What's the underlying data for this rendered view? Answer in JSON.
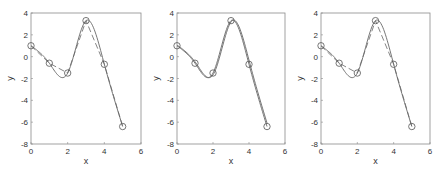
{
  "chart_data": [
    {
      "type": "line",
      "title": "",
      "xlabel": "x",
      "ylabel": "y",
      "xlim": [
        0,
        6
      ],
      "ylim": [
        -8,
        4
      ],
      "xticks": [
        0,
        2,
        4,
        6
      ],
      "yticks": [
        4,
        2,
        0,
        -2,
        -4,
        -6,
        -8
      ],
      "grid": false,
      "legend": null,
      "series": [
        {
          "name": "data",
          "style": "markers-circle",
          "x": [
            0,
            1,
            2,
            3,
            4,
            5
          ],
          "y": [
            1.0,
            -0.6,
            -1.5,
            3.3,
            -0.7,
            -6.4
          ]
        },
        {
          "name": "linear",
          "style": "dashed",
          "x": [
            0,
            1,
            2,
            3,
            4,
            5
          ],
          "y": [
            1.0,
            -0.6,
            -1.5,
            3.3,
            -0.7,
            -6.4
          ]
        },
        {
          "name": "spline",
          "style": "solid",
          "method": "cubic-spline"
        }
      ]
    },
    {
      "type": "line",
      "title": "",
      "xlabel": "x",
      "ylabel": "y",
      "xlim": [
        0,
        6
      ],
      "ylim": [
        -8,
        4
      ],
      "xticks": [
        0,
        2,
        4,
        6
      ],
      "yticks": [
        4,
        2,
        0,
        -2,
        -4,
        -6,
        -8
      ],
      "grid": false,
      "legend": null,
      "series": [
        {
          "name": "data",
          "style": "markers-circle",
          "x": [
            0,
            1,
            2,
            3,
            4,
            5
          ],
          "y": [
            1.0,
            -0.6,
            -1.5,
            3.3,
            -0.7,
            -6.4
          ]
        },
        {
          "name": "spline",
          "style": "solid",
          "method": "cubic-spline"
        },
        {
          "name": "spline-alt",
          "style": "solid",
          "method": "cubic-spline-shifted"
        }
      ]
    },
    {
      "type": "line",
      "title": "",
      "xlabel": "x",
      "ylabel": "y",
      "xlim": [
        0,
        6
      ],
      "ylim": [
        -8,
        4
      ],
      "xticks": [
        0,
        2,
        4,
        6
      ],
      "yticks": [
        4,
        2,
        0,
        -2,
        -4,
        -6,
        -8
      ],
      "grid": false,
      "legend": null,
      "series": [
        {
          "name": "data",
          "style": "markers-circle",
          "x": [
            0,
            1,
            2,
            3,
            4,
            5
          ],
          "y": [
            1.0,
            -0.6,
            -1.5,
            3.3,
            -0.7,
            -6.4
          ]
        },
        {
          "name": "linear",
          "style": "dashed",
          "x": [
            0,
            1,
            2,
            3,
            4,
            5
          ],
          "y": [
            1.0,
            -0.6,
            -1.5,
            3.3,
            -0.7,
            -6.4
          ]
        },
        {
          "name": "spline",
          "style": "solid",
          "method": "cubic-spline"
        }
      ]
    }
  ],
  "panels": [
    {
      "xlabel": "x",
      "ylabel": "y"
    },
    {
      "xlabel": "x",
      "ylabel": "y"
    },
    {
      "xlabel": "x",
      "ylabel": "y"
    }
  ],
  "colors": {
    "axis": "#8a8a8a",
    "line": "#666666",
    "marker": "#555555",
    "text": "#333333"
  }
}
